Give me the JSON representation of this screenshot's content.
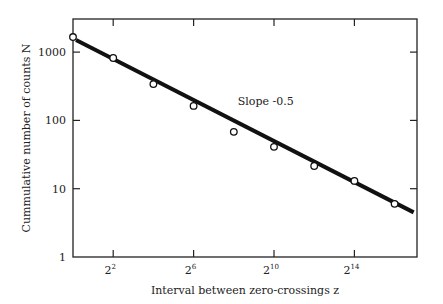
{
  "chart_data": {
    "type": "scatter",
    "title": "",
    "xlabel": "Interval between zero-crossings z",
    "ylabel": "Cummulative number of counts N",
    "xscale": "log2",
    "yscale": "log10",
    "xlim_log2": [
      0,
      17.2
    ],
    "ylim": [
      1,
      3000
    ],
    "x_ticks": [
      {
        "exp": 2,
        "label": "2",
        "sup": "2"
      },
      {
        "exp": 6,
        "label": "2",
        "sup": "6"
      },
      {
        "exp": 10,
        "label": "2",
        "sup": "10"
      },
      {
        "exp": 14,
        "label": "2",
        "sup": "14"
      }
    ],
    "y_ticks": [
      {
        "value": 1,
        "label": "1"
      },
      {
        "value": 10,
        "label": "10"
      },
      {
        "value": 100,
        "label": "100"
      },
      {
        "value": 1000,
        "label": "1000"
      }
    ],
    "series": [
      {
        "name": "observed",
        "marker": "open-circle",
        "x_log2": [
          0,
          2,
          4,
          6,
          8,
          10,
          12,
          14,
          16
        ],
        "values": [
          1660,
          820,
          340,
          163,
          68,
          41,
          21.5,
          13,
          6
        ]
      },
      {
        "name": "fit",
        "style": "thick-line",
        "x_log2": [
          0.15,
          16.95
        ],
        "values": [
          1500,
          4.5
        ]
      }
    ],
    "annotations": [
      {
        "text": "Slope -0.5",
        "x_log2": 8.2,
        "y": 170
      }
    ],
    "grid": false,
    "legend": null
  }
}
